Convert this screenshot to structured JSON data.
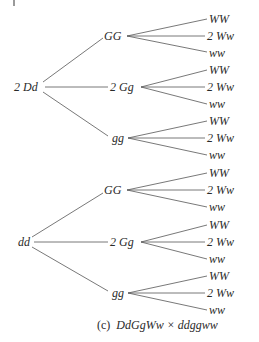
{
  "figure": {
    "caption_prefix": "(c)",
    "caption_cross": "DdGgWw × ddggww",
    "line_color": "#555555"
  },
  "tree": [
    {
      "label": "2 Dd",
      "children": [
        {
          "label": "GG",
          "children": [
            "WW",
            "2 Ww",
            "ww"
          ]
        },
        {
          "label": "2 Gg",
          "children": [
            "WW",
            "2 Ww",
            "ww"
          ]
        },
        {
          "label": "gg",
          "children": [
            "WW",
            "2 Ww",
            "ww"
          ]
        }
      ]
    },
    {
      "label": "dd",
      "children": [
        {
          "label": "GG",
          "children": [
            "WW",
            "2 Ww",
            "ww"
          ]
        },
        {
          "label": "2 Gg",
          "children": [
            "WW",
            "2 Ww",
            "ww"
          ]
        },
        {
          "label": "gg",
          "children": [
            "WW",
            "2 Ww",
            "ww"
          ]
        }
      ]
    }
  ]
}
